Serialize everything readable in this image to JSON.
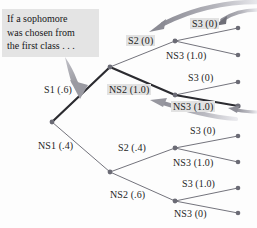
{
  "figure": {
    "type": "probability-tree-diagram",
    "background_color": "#fdfdfd",
    "text_color": "#1d1d1d",
    "highlight_color": "#e2e2e2",
    "callout_bg_color": "#e4e4e4",
    "branch_color": "#5a5a64",
    "bold_branch_color": "#2b2b30",
    "node_color": "#6b6b75",
    "arrow_color": "#a8a8ae"
  },
  "callout": {
    "name": "sophomore-callout",
    "lines": [
      "If a sophomore",
      "was chosen from",
      "the first class . . ."
    ]
  },
  "branches": {
    "level1": [
      {
        "id": "s1",
        "label": "S1 (.6)",
        "outcome": "S1",
        "probability": ".6",
        "bold": true,
        "highlighted": false
      },
      {
        "id": "ns1",
        "label": "NS1 (.4)",
        "outcome": "NS1",
        "probability": ".4",
        "bold": false,
        "highlighted": false
      }
    ],
    "level2": [
      {
        "id": "s2a",
        "label": "S2 (0)",
        "outcome": "S2",
        "probability": "0",
        "bold": false,
        "highlighted": true
      },
      {
        "id": "ns2a",
        "label": "NS2 (1.0)",
        "outcome": "NS2",
        "probability": "1.0",
        "bold": true,
        "highlighted": true
      },
      {
        "id": "s2b",
        "label": "S2 (.4)",
        "outcome": "S2",
        "probability": ".4",
        "bold": false,
        "highlighted": false
      },
      {
        "id": "ns2b",
        "label": "NS2 (.6)",
        "outcome": "NS2",
        "probability": ".6",
        "bold": false,
        "highlighted": false
      }
    ],
    "level3": [
      {
        "id": "s3a",
        "label": "S3 (0)",
        "outcome": "S3",
        "probability": "0",
        "bold": false,
        "highlighted": true
      },
      {
        "id": "ns3a",
        "label": "NS3 (1.0)",
        "outcome": "NS3",
        "probability": "1.0",
        "bold": false,
        "highlighted": false
      },
      {
        "id": "s3b",
        "label": "S3 (0)",
        "outcome": "S3",
        "probability": "0",
        "bold": false,
        "highlighted": false
      },
      {
        "id": "ns3b",
        "label": "NS3 (1.0)",
        "outcome": "NS3",
        "probability": "1.0",
        "bold": true,
        "highlighted": true
      },
      {
        "id": "s3c",
        "label": "S3 (0)",
        "outcome": "S3",
        "probability": "0",
        "bold": false,
        "highlighted": false
      },
      {
        "id": "ns3c",
        "label": "NS3 (1.0)",
        "outcome": "NS3",
        "probability": "1.0",
        "bold": false,
        "highlighted": false
      },
      {
        "id": "s3d",
        "label": "S3 (1.0)",
        "outcome": "S3",
        "probability": "1.0",
        "bold": false,
        "highlighted": false
      },
      {
        "id": "ns3d",
        "label": "NS3 (0)",
        "outcome": "NS3",
        "probability": "0",
        "bold": false,
        "highlighted": false
      }
    ]
  },
  "annotation_arrows": [
    {
      "name": "callout-arrow",
      "points_to": "S1 (.6)",
      "style": "tapered-straight"
    },
    {
      "name": "top-curved-arrow",
      "points_to": "S2 (0)",
      "style": "thick-curved"
    },
    {
      "name": "s3-right-arrow",
      "points_to": "S3 (0)",
      "style": "thick-curved"
    },
    {
      "name": "ns3-curved-arrow",
      "points_to": "NS2 (1.0)",
      "style": "thick-curved"
    },
    {
      "name": "ns3-right-arrow",
      "points_to": "NS3 (1.0)",
      "style": "thick-curved"
    }
  ]
}
